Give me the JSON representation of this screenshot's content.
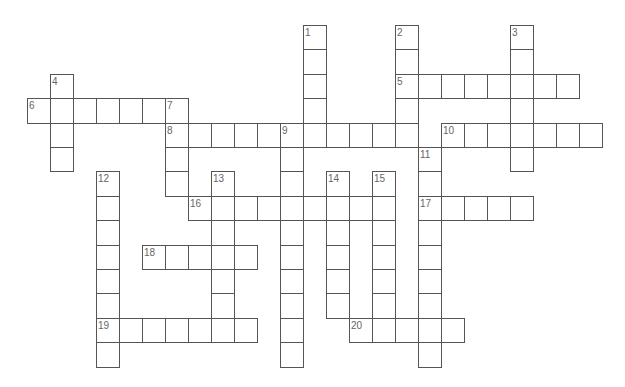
{
  "puzzle": {
    "type": "crossword",
    "cell_width": 23,
    "cell_height": 24.4,
    "origin_x": 27,
    "origin_y": 25,
    "border_color": "#555555",
    "label_color": "#666666",
    "entries": [
      {
        "number": "1",
        "direction": "down",
        "col": 12,
        "row": 0,
        "length": 5
      },
      {
        "number": "2",
        "direction": "down",
        "col": 16,
        "row": 0,
        "length": 5
      },
      {
        "number": "3",
        "direction": "down",
        "col": 21,
        "row": 0,
        "length": 6
      },
      {
        "number": "4",
        "direction": "down",
        "col": 1,
        "row": 2,
        "length": 4
      },
      {
        "number": "5",
        "direction": "across",
        "col": 16,
        "row": 2,
        "length": 8
      },
      {
        "number": "6",
        "direction": "across",
        "col": 0,
        "row": 3,
        "length": 7
      },
      {
        "number": "7",
        "direction": "down",
        "col": 6,
        "row": 3,
        "length": 4
      },
      {
        "number": "8",
        "direction": "across",
        "col": 6,
        "row": 4,
        "length": 11
      },
      {
        "number": "9",
        "direction": "down",
        "col": 11,
        "row": 4,
        "length": 10
      },
      {
        "number": "10",
        "direction": "across",
        "col": 18,
        "row": 4,
        "length": 7
      },
      {
        "number": "11",
        "direction": "down",
        "col": 17,
        "row": 5,
        "length": 9
      },
      {
        "number": "12",
        "direction": "down",
        "col": 3,
        "row": 6,
        "length": 8
      },
      {
        "number": "13",
        "direction": "down",
        "col": 8,
        "row": 6,
        "length": 7
      },
      {
        "number": "14",
        "direction": "down",
        "col": 13,
        "row": 6,
        "length": 6
      },
      {
        "number": "15",
        "direction": "down",
        "col": 15,
        "row": 6,
        "length": 7
      },
      {
        "number": "16",
        "direction": "across",
        "col": 7,
        "row": 7,
        "length": 9
      },
      {
        "number": "17",
        "direction": "across",
        "col": 17,
        "row": 7,
        "length": 5
      },
      {
        "number": "18",
        "direction": "across",
        "col": 5,
        "row": 9,
        "length": 5
      },
      {
        "number": "19",
        "direction": "across",
        "col": 3,
        "row": 12,
        "length": 7
      },
      {
        "number": "20",
        "direction": "across",
        "col": 14,
        "row": 12,
        "length": 5
      }
    ]
  }
}
